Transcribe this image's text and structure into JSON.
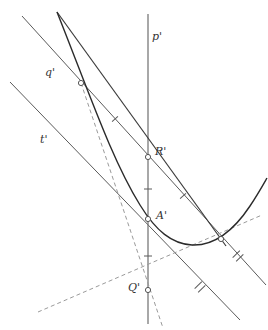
{
  "figure": {
    "type": "geometry-diagram",
    "title": "",
    "width": 268,
    "height": 330,
    "background": "#ffffff",
    "stroke_color": "#4a4a4a",
    "curve_color": "#2b2b2b",
    "dashed_color": "#808080",
    "label_color": "#333333"
  },
  "labels": {
    "p_prime": "p'",
    "q_prime": "q'",
    "t_prime": "t'",
    "R_prime": "R'",
    "A_prime": "A'",
    "Q_prime": "Q'"
  },
  "label_positions": {
    "p_prime": {
      "x": 152,
      "y": 30
    },
    "q_prime": {
      "x": 45,
      "y": 66
    },
    "t_prime": {
      "x": 40,
      "y": 133
    },
    "R_prime": {
      "x": 155,
      "y": 145
    },
    "A_prime": {
      "x": 156,
      "y": 209
    },
    "Q_prime": {
      "x": 128,
      "y": 281
    }
  },
  "points": {
    "q_intersection": {
      "x": 81,
      "y": 83,
      "label": ""
    },
    "R_prime": {
      "x": 148,
      "y": 157,
      "label": "R'"
    },
    "A_prime": {
      "x": 148,
      "y": 219,
      "label": "A'"
    },
    "Q_prime": {
      "x": 148,
      "y": 290,
      "label": "Q'"
    },
    "right_intersection": {
      "x": 220,
      "y": 237,
      "label": ""
    }
  },
  "lines": {
    "p_prime": {
      "name": "p'",
      "style": "solid",
      "x1": 148,
      "y1": 14,
      "x2": 148,
      "y2": 324
    },
    "q_prime": {
      "name": "q'",
      "style": "solid",
      "x1": 22,
      "y1": 16,
      "x2": 266,
      "y2": 285
    },
    "t_prime": {
      "name": "t'",
      "style": "solid",
      "x1": 10,
      "y1": 82,
      "x2": 240,
      "y2": 320
    },
    "steep_chord": {
      "name": "steep-chord",
      "style": "solid",
      "x1": 57,
      "y1": 12,
      "x2": 228,
      "y2": 249
    },
    "dashed_steep": {
      "name": "dashed-steep",
      "style": "dashed",
      "x1": 81,
      "y1": 83,
      "x2": 163,
      "y2": 328
    },
    "dashed_shallow": {
      "name": "dashed-shallow",
      "style": "dashed",
      "x1": 38,
      "y1": 312,
      "x2": 262,
      "y2": 215
    }
  },
  "curve": {
    "name": "parabola",
    "style": "solid",
    "path": "M 57 12 C 95 110 118 175 152 222 C 175 253 200 249 228 222 C 244 205 254 192 266 178"
  },
  "tick_marks": {
    "single": [
      {
        "x": 115,
        "y": 119,
        "angle": 47,
        "count": 1,
        "on": "q'"
      },
      {
        "x": 183,
        "y": 196,
        "angle": 47,
        "count": 1,
        "on": "q'"
      },
      {
        "x": 148,
        "y": 189,
        "angle": 0,
        "count": 1,
        "on": "p'"
      },
      {
        "x": 148,
        "y": 256,
        "angle": 0,
        "count": 1,
        "on": "p'"
      }
    ],
    "double": [
      {
        "x": 238,
        "y": 256,
        "angle": 46,
        "count": 2,
        "on": "q'"
      },
      {
        "x": 200,
        "y": 287,
        "angle": 46,
        "count": 2,
        "on": "t'"
      }
    ]
  }
}
